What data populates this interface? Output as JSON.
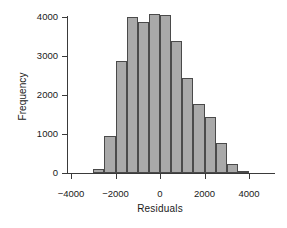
{
  "chart_data": {
    "type": "bar",
    "title": "",
    "xlabel": "Residuals",
    "ylabel": "Frequency",
    "xlim": [
      -4250,
      4350
    ],
    "ylim": [
      0,
      4250
    ],
    "grid": false,
    "legend": null,
    "bin_width": 500,
    "bin_left_edges": [
      -3000,
      -2500,
      -2000,
      -1500,
      -1000,
      -500,
      0,
      500,
      1000,
      1500,
      2000,
      2500,
      3000,
      3500
    ],
    "bin_centers": [
      -2750,
      -2250,
      -1750,
      -1250,
      -750,
      -250,
      250,
      750,
      1250,
      1750,
      2250,
      2750,
      3250,
      3750
    ],
    "values": [
      100,
      950,
      2880,
      4000,
      3880,
      4080,
      4050,
      3380,
      2440,
      1780,
      1440,
      780,
      220,
      50
    ],
    "x_ticks": [
      -4000,
      -2000,
      0,
      2000,
      4000
    ],
    "x_tick_labels": [
      "−4000",
      "−2000",
      "0",
      "2000",
      "4000"
    ],
    "y_ticks": [
      0,
      1000,
      2000,
      3000,
      4000
    ],
    "y_tick_labels": [
      "0",
      "1000",
      "2000",
      "3000",
      "4000"
    ],
    "bar_fill_color": "#a9a9a9",
    "bar_edge_color": "#4a4a4a",
    "axis_color": "#3a3a3a",
    "background_color": "#ffffff"
  }
}
